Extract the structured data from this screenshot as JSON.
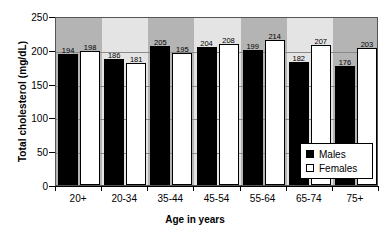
{
  "chart_data": {
    "type": "bar",
    "title": "",
    "xlabel": "Age in years",
    "ylabel": "Total cholesterol (mg/dL)",
    "categories": [
      "20+",
      "20-34",
      "35-44",
      "45-54",
      "55-64",
      "65-74",
      "75+"
    ],
    "series": [
      {
        "name": "Males",
        "color": "#000000",
        "values": [
          194,
          186,
          205,
          204,
          199,
          182,
          176
        ]
      },
      {
        "name": "Females",
        "color": "#ffffff",
        "values": [
          198,
          181,
          195,
          208,
          214,
          207,
          203
        ]
      }
    ],
    "ylim": [
      0,
      250
    ],
    "yticks": [
      0,
      50,
      100,
      150,
      200,
      250
    ],
    "grid": true,
    "legend_position": "bottom-right",
    "data_labels": true
  },
  "legend": {
    "entries": [
      {
        "label": "Males"
      },
      {
        "label": "Females"
      }
    ]
  },
  "axes": {
    "y_title": "Total cholesterol (mg/dL)",
    "x_title": "Age in years"
  },
  "colors": {
    "males": "#000000",
    "females": "#ffffff",
    "plot_background": "#f0f0f0",
    "band": "#b4b4b4",
    "gridline": "#8a8a8a",
    "axis": "#000000"
  }
}
